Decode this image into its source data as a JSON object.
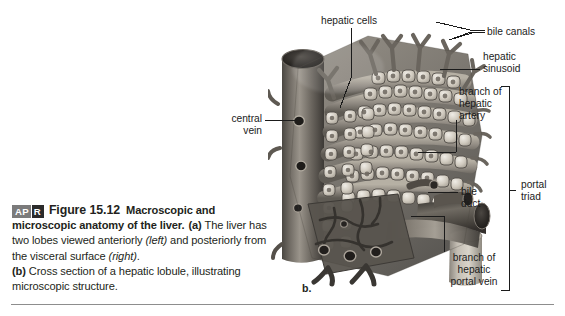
{
  "figure": {
    "badge_ap": "AP",
    "badge_r": "R",
    "number": "Figure 15.12",
    "title": "Macroscopic and microscopic anatomy of the liver.",
    "part_a_marker": "(a)",
    "part_a_text_1": " The liver has two lobes viewed anteriorly ",
    "part_a_italic_1": "(left)",
    "part_a_text_2": " and posteriorly from the visceral surface ",
    "part_a_italic_2": "(right)",
    "part_a_text_3": ".",
    "part_b_marker": "(b)",
    "part_b_text": " Cross section of a hepatic lobule, illustrating microscopic structure.",
    "panel_letter": "b."
  },
  "labels": {
    "hepatic_cells": "hepatic cells",
    "bile_canals": "bile canals",
    "hepatic_sinusoid_line1": "hepatic",
    "hepatic_sinusoid_line2": "sinusoid",
    "branch_hepatic_artery_line1": "branch of",
    "branch_hepatic_artery_line2": "hepatic",
    "branch_hepatic_artery_line3": "artery",
    "central_vein_line1": "central",
    "central_vein_line2": "vein",
    "bile_duct_line1": "bile",
    "bile_duct_line2": "duct",
    "portal_triad_line1": "portal",
    "portal_triad_line2": "triad",
    "branch_hepatic_portal_vein_line1": "branch of",
    "branch_hepatic_portal_vein_line2": "hepatic",
    "branch_hepatic_portal_vein_line3": "portal vein"
  },
  "colors": {
    "text": "#231f20",
    "label": "#1b1b1b",
    "rule": "#8d8d8d",
    "badge_ap_bg": "#7b7b7b",
    "badge_r_bg": "#2b2b2b",
    "page_bg": "#ffffff"
  }
}
